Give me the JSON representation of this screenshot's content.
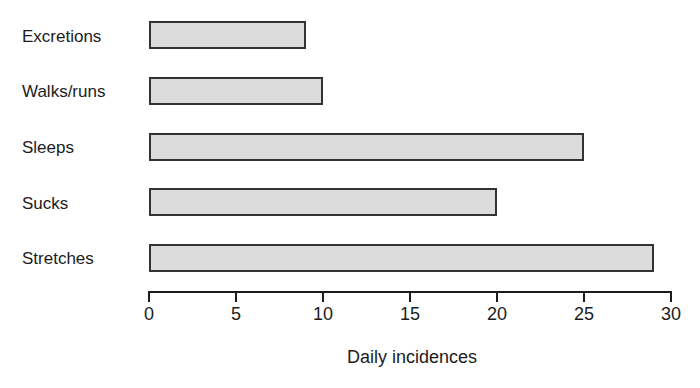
{
  "chart_data": {
    "type": "bar",
    "orientation": "horizontal",
    "title": "",
    "xlabel": "Daily incidences",
    "ylabel": "",
    "categories": [
      "Excretions",
      "Walks/runs",
      "Sleeps",
      "Sucks",
      "Stretches"
    ],
    "values": [
      9,
      10,
      25,
      20,
      29
    ],
    "xlim": [
      0,
      30
    ],
    "xticks": [
      0,
      5,
      10,
      15,
      20,
      25,
      30
    ],
    "xtick_labels": [
      "0",
      "5",
      "10",
      "15",
      "20",
      "25",
      "30"
    ],
    "grid": false,
    "legend": null,
    "bar_fill_color": "#dcdcdc",
    "bar_border_color": "#333333",
    "axis_color": "#1c1c1c"
  },
  "axis": {
    "title": "Daily incidences"
  }
}
